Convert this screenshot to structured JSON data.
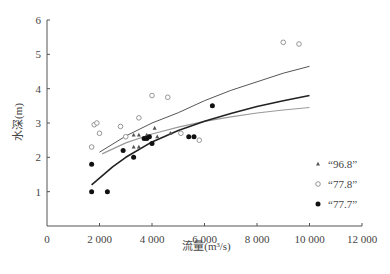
{
  "chart_data": {
    "type": "scatter",
    "title": "",
    "xlabel": "流量(m³/s)",
    "ylabel": "水深(m)",
    "xlim": [
      0,
      12000
    ],
    "ylim": [
      0,
      6
    ],
    "x_ticks": [
      0,
      2000,
      4000,
      6000,
      8000,
      10000,
      12000
    ],
    "x_tick_labels": [
      "0",
      "2 000",
      "4 000",
      "6 000",
      "8 000",
      "10 000",
      "12 000"
    ],
    "y_ticks": [
      1,
      2,
      3,
      4,
      5,
      6
    ],
    "y_tick_labels": [
      "1",
      "2",
      "3",
      "4",
      "5",
      "6"
    ],
    "grid": false,
    "legend_position": "right-inside-lower",
    "series": [
      {
        "name": "“96.8”",
        "marker": "triangle",
        "color": "#555555",
        "points": [
          [
            3300,
            2.65
          ],
          [
            3500,
            2.65
          ],
          [
            3800,
            2.65
          ],
          [
            4100,
            2.85
          ],
          [
            4200,
            2.6
          ],
          [
            4700,
            2.7
          ],
          [
            3300,
            2.3
          ],
          [
            3500,
            2.3
          ]
        ],
        "fit_curve": {
          "color": "#9a9a9a",
          "width": 1.2,
          "points": [
            [
              2100,
              2.1
            ],
            [
              3000,
              2.42
            ],
            [
              4000,
              2.68
            ],
            [
              5000,
              2.88
            ],
            [
              6000,
              3.05
            ],
            [
              7000,
              3.18
            ],
            [
              8000,
              3.29
            ],
            [
              9000,
              3.38
            ],
            [
              10000,
              3.45
            ]
          ]
        }
      },
      {
        "name": "“77.8”",
        "marker": "open-circle",
        "color": "#8a8a8a",
        "points": [
          [
            1700,
            2.3
          ],
          [
            1800,
            2.95
          ],
          [
            1900,
            3.0
          ],
          [
            2000,
            2.7
          ],
          [
            2800,
            2.9
          ],
          [
            3000,
            2.6
          ],
          [
            3500,
            3.15
          ],
          [
            4000,
            3.8
          ],
          [
            4600,
            3.75
          ],
          [
            5100,
            2.7
          ],
          [
            5800,
            2.5
          ],
          [
            9000,
            5.35
          ],
          [
            9600,
            5.3
          ]
        ],
        "fit_curve": {
          "color": "#555555",
          "width": 1.0,
          "points": [
            [
              2000,
              2.15
            ],
            [
              3000,
              2.62
            ],
            [
              4000,
              3.0
            ],
            [
              5000,
              3.3
            ],
            [
              6000,
              3.65
            ],
            [
              7000,
              3.95
            ],
            [
              8000,
              4.2
            ],
            [
              9000,
              4.45
            ],
            [
              10000,
              4.65
            ]
          ]
        }
      },
      {
        "name": "“77.7”",
        "marker": "filled-circle",
        "color": "#111111",
        "points": [
          [
            1700,
            1.0
          ],
          [
            1700,
            1.8
          ],
          [
            2300,
            1.0
          ],
          [
            2900,
            2.2
          ],
          [
            3300,
            2.0
          ],
          [
            3700,
            2.55
          ],
          [
            3800,
            2.55
          ],
          [
            3900,
            2.6
          ],
          [
            4000,
            2.4
          ],
          [
            5400,
            2.6
          ],
          [
            5600,
            2.6
          ],
          [
            6300,
            3.5
          ]
        ],
        "fit_curve": {
          "color": "#222222",
          "width": 1.6,
          "points": [
            [
              1700,
              1.2
            ],
            [
              2500,
              1.72
            ],
            [
              3000,
              2.0
            ],
            [
              4000,
              2.45
            ],
            [
              5000,
              2.78
            ],
            [
              6000,
              3.05
            ],
            [
              7000,
              3.28
            ],
            [
              8000,
              3.48
            ],
            [
              9000,
              3.65
            ],
            [
              10000,
              3.8
            ]
          ]
        }
      }
    ]
  }
}
